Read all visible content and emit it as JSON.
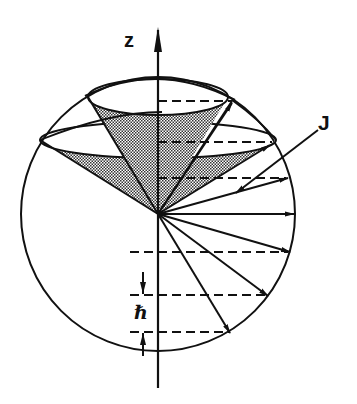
{
  "figure": {
    "labels": {
      "z_axis": "z",
      "angular_momentum": "J",
      "spacing": "ℏ"
    },
    "colors": {
      "stroke": "#111111",
      "background": "#ffffff",
      "cone_fill": "#9a9a9a"
    },
    "projection_levels_count": 6,
    "arrows_count": 8
  }
}
